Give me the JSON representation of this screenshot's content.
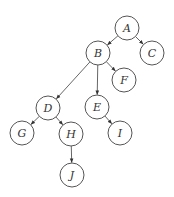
{
  "diagram": {
    "type": "directed-tree",
    "node_radius": 12,
    "colors": {
      "background": "#ffffff",
      "stroke": "#555555",
      "text": "#333333"
    },
    "nodes": [
      {
        "id": "A",
        "label": "A",
        "x": 127,
        "y": 28
      },
      {
        "id": "B",
        "label": "B",
        "x": 98,
        "y": 53
      },
      {
        "id": "C",
        "label": "C",
        "x": 152,
        "y": 53
      },
      {
        "id": "F",
        "label": "F",
        "x": 124,
        "y": 80
      },
      {
        "id": "D",
        "label": "D",
        "x": 48,
        "y": 108
      },
      {
        "id": "E",
        "label": "E",
        "x": 97,
        "y": 107
      },
      {
        "id": "G",
        "label": "G",
        "x": 22,
        "y": 133
      },
      {
        "id": "H",
        "label": "H",
        "x": 71,
        "y": 134
      },
      {
        "id": "I",
        "label": "I",
        "x": 120,
        "y": 133
      },
      {
        "id": "J",
        "label": "J",
        "x": 72,
        "y": 175
      }
    ],
    "edges": [
      {
        "from": "A",
        "to": "B"
      },
      {
        "from": "A",
        "to": "C"
      },
      {
        "from": "B",
        "to": "D"
      },
      {
        "from": "B",
        "to": "E"
      },
      {
        "from": "B",
        "to": "F"
      },
      {
        "from": "D",
        "to": "G"
      },
      {
        "from": "D",
        "to": "H"
      },
      {
        "from": "E",
        "to": "I"
      },
      {
        "from": "H",
        "to": "J"
      }
    ]
  }
}
